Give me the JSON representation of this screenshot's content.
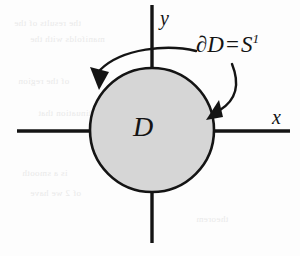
{
  "figure": {
    "axes": {
      "x_label": "x",
      "y_label": "y"
    },
    "region": {
      "label": "D",
      "fill_color": "#d6d6d6",
      "stroke_color": "#141414"
    },
    "boundary": {
      "symbol": "∂D",
      "equals": "=",
      "sphere": "S",
      "sphere_exponent": "1"
    },
    "annotations": {
      "left_arrow": "orientation-arrow-left",
      "right_arrow": "boundary-pointer-arrow-right"
    },
    "background_bleed": [
      "the results of the",
      "manifolds with the",
      "of the region",
      "continuation that",
      "is a smooth",
      "of 2 we have",
      "theorem"
    ]
  }
}
